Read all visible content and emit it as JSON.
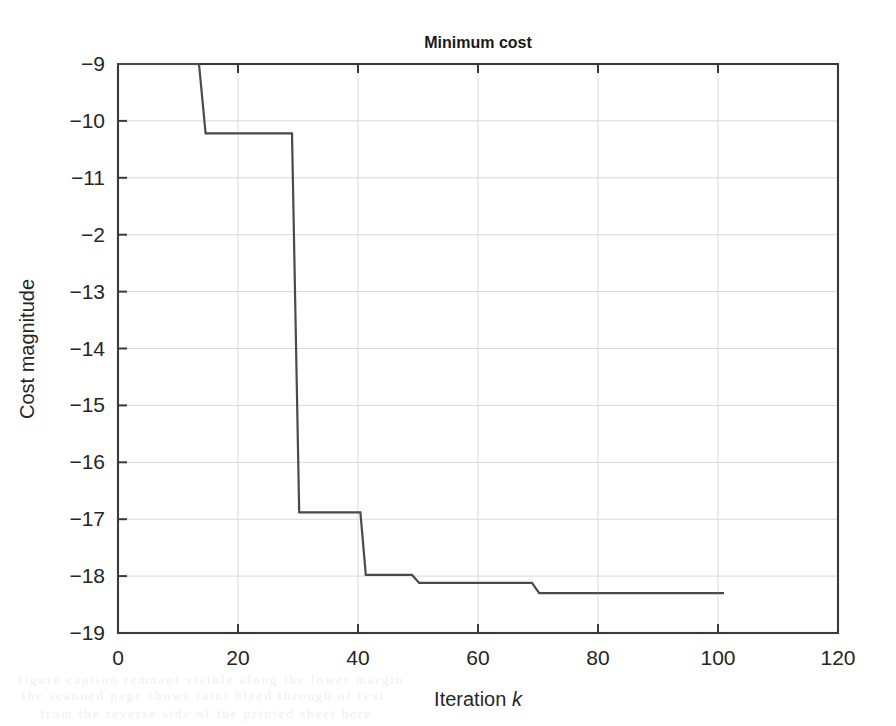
{
  "figure": {
    "title": "Minimum cost",
    "xlabel_prefix": "Iteration ",
    "xlabel_symbol": "k",
    "ylabel": "Cost magnitude"
  },
  "axes": {
    "x_ticks": [
      "0",
      "20",
      "40",
      "60",
      "80",
      "100",
      "120"
    ],
    "y_ticks": [
      "-9",
      "-10",
      "-11",
      "-2",
      "-13",
      "-14",
      "-15",
      "-16",
      "-17",
      "-18",
      "-19"
    ]
  },
  "artifacts": {
    "bleed_line_1": "the scanned page shows faint bleed through of text",
    "bleed_line_2": "from the reverse side of the printed sheet here",
    "bleed_line_3": "figure caption remnant visible along the lower margin"
  },
  "chart_data": {
    "type": "line",
    "title": "Minimum cost",
    "xlabel": "Iteration k",
    "ylabel": "Cost magnitude",
    "xlim": [
      0,
      120
    ],
    "ylim": [
      -19,
      -9
    ],
    "xticks": [
      0,
      20,
      40,
      60,
      80,
      100,
      120
    ],
    "yticks": [
      -9,
      -10,
      -11,
      -12,
      -13,
      -14,
      -15,
      -16,
      -17,
      -18,
      -19
    ],
    "ytick_labels": [
      "-9",
      "-10",
      "-11",
      "-2",
      "-13",
      "-14",
      "-15",
      "-16",
      "-17",
      "-18",
      "-19"
    ],
    "ytick_label_note": "the fourth label renders as -2 in the scan; the underlying tick value is -12",
    "grid": true,
    "legend": null,
    "series": [
      {
        "name": "minimum cost",
        "style": "staircase",
        "color": "#4a4a4a",
        "x": [
          0,
          13.5,
          14.6,
          29.0,
          30.2,
          40.4,
          41.3,
          49.0,
          50.2,
          69.0,
          70.2,
          101.0
        ],
        "y": [
          -9.0,
          -9.0,
          -10.22,
          -10.22,
          -16.88,
          -16.88,
          -17.98,
          -17.98,
          -18.12,
          -18.12,
          -18.3,
          -18.3
        ],
        "steps": [
          {
            "iteration": 0,
            "value": -9.0
          },
          {
            "iteration": 14,
            "value": -10.22
          },
          {
            "iteration": 29,
            "value": -16.88
          },
          {
            "iteration": 41,
            "value": -17.98
          },
          {
            "iteration": 50,
            "value": -18.12
          },
          {
            "iteration": 70,
            "value": -18.3
          },
          {
            "iteration": 101,
            "value": -18.3
          }
        ]
      }
    ]
  }
}
